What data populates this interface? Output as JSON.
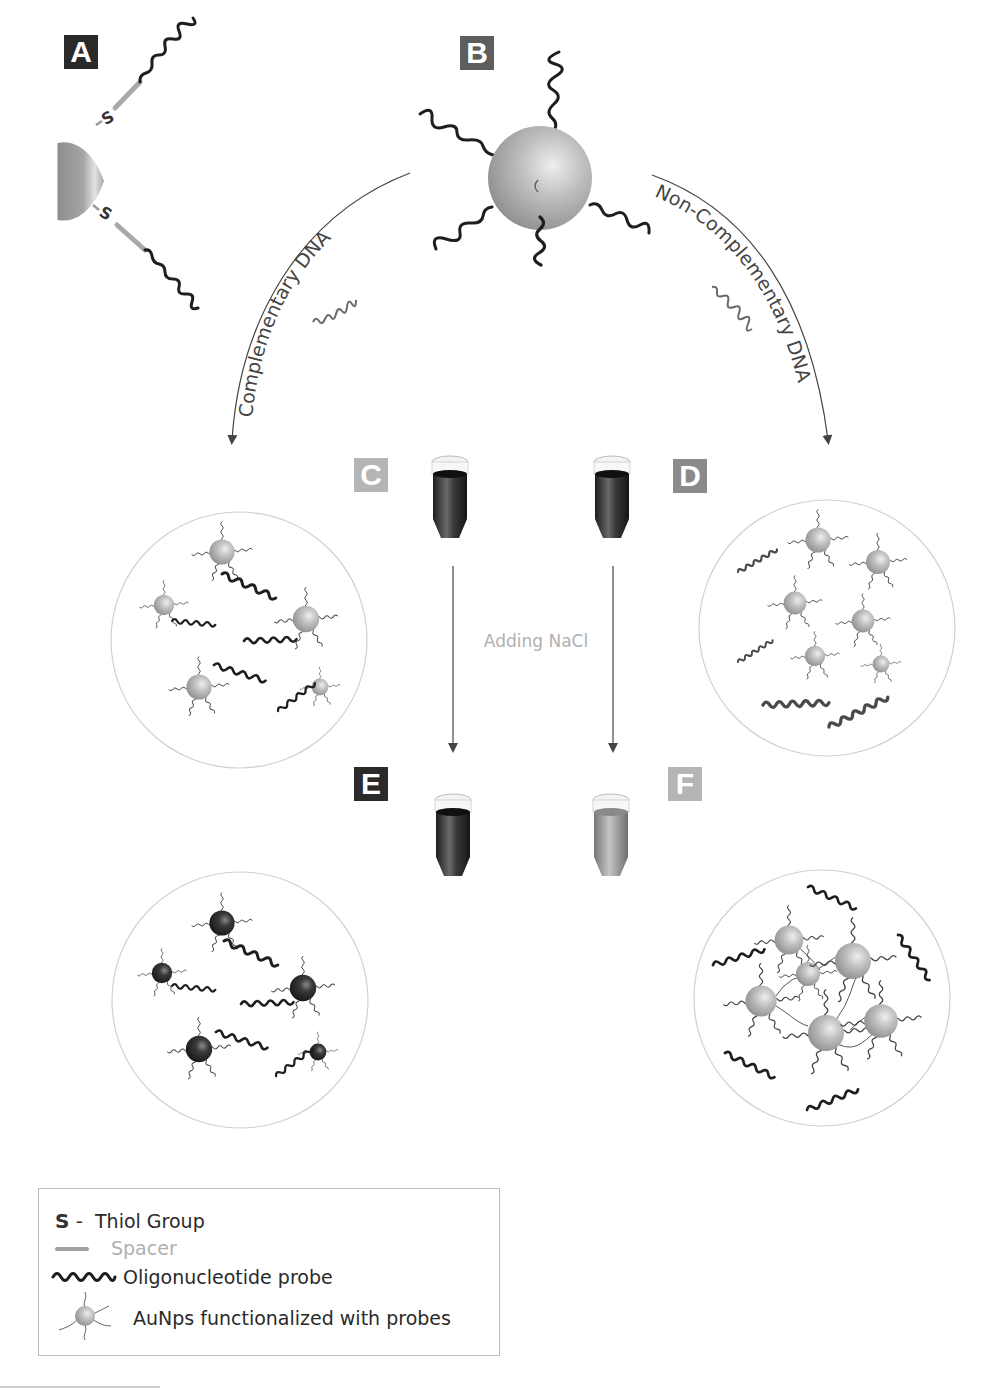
{
  "panels": {
    "A": {
      "label": "A",
      "description": "Gold nanoparticle with thiol-spacer-oligonucleotide probes"
    },
    "B": {
      "label": "B",
      "description": "Gold nanoparticle functionalized with oligonucleotide probes"
    },
    "C": {
      "label": "C",
      "tube_color": "#2b2b2b",
      "description": "Probe + complementary DNA (red solution)"
    },
    "D": {
      "label": "D",
      "tube_color": "#2b2b2b",
      "description": "Probe + non-complementary DNA (red solution)"
    },
    "E": {
      "label": "E",
      "tube_color": "#2b2b2b",
      "description": "After NaCl: remains dispersed"
    },
    "F": {
      "label": "F",
      "tube_color": "#9a9a9a",
      "description": "After NaCl: aggregated"
    }
  },
  "arrows": {
    "left_label": "Complementary DNA",
    "right_label": "Non-Complementary DNA",
    "middle_label": "Adding NaCl"
  },
  "atoms": {
    "thiol_symbol": "S"
  },
  "legend": {
    "items": [
      {
        "icon": "thiol-icon",
        "symbol": "S",
        "text": "Thiol Group"
      },
      {
        "icon": "spacer-icon",
        "text": "Spacer"
      },
      {
        "icon": "oligonucleotide-icon",
        "text": "Oligonucleotide probe"
      },
      {
        "icon": "aunp-icon",
        "text": "AuNps functionalized with probes"
      }
    ]
  },
  "colors": {
    "label_dark": "#2a2a2a",
    "label_mid": "#5e5e5e",
    "label_light": "#b5b5b5",
    "particle": "#b8b8b8",
    "particle_dark": "#3a3a3a",
    "strand": "#1e1e1e",
    "circle_outline": "#d0d0d0",
    "nacl_text": "#b0b0b0"
  }
}
